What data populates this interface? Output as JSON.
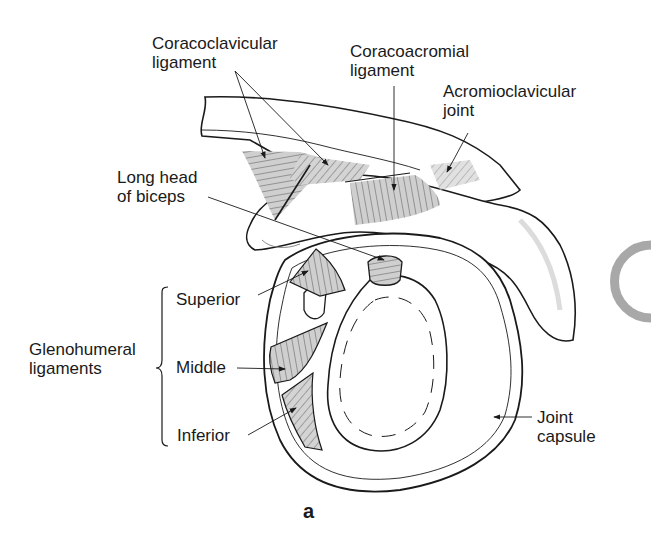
{
  "figure": {
    "panel_label": "a",
    "labels": {
      "coracoclavicular": [
        "Coracoclavicular",
        "ligament"
      ],
      "coracoacromial": [
        "Coracoacromial",
        "ligament"
      ],
      "acromioclavicular": [
        "Acromioclavicular",
        "joint"
      ],
      "long_head_biceps": [
        "Long head",
        "of biceps"
      ],
      "glenohumeral": [
        "Glenohumeral",
        "ligaments"
      ],
      "superior": "Superior",
      "middle": "Middle",
      "inferior": "Inferior",
      "joint_capsule": [
        "Joint",
        "capsule"
      ]
    },
    "colors": {
      "line": "#1a1a1a",
      "ligament_fill": "#c8c8c8",
      "shade": "#e6e6e6",
      "partial_circle": "#a8a8a8"
    }
  }
}
